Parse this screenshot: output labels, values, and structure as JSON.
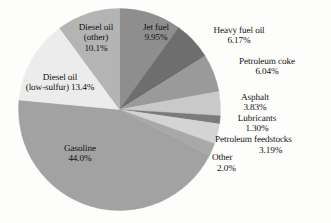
{
  "chart_data": {
    "type": "pie",
    "title": "",
    "subtitle": "",
    "xlabel": "",
    "ylabel": "",
    "legend_position": "none",
    "grid": false,
    "units": "percent",
    "start_angle_deg": 0,
    "direction": "clockwise",
    "categories": [
      "Jet fuel",
      "Heavy fuel oil",
      "Petroleum coke",
      "Asphalt",
      "Lubricants",
      "Petroleum feedstocks",
      "Other",
      "Gasoline",
      "Diesel oil (low-sulfur)",
      "Diesel oil (other)"
    ],
    "values": [
      9.95,
      6.17,
      6.04,
      3.83,
      1.3,
      3.19,
      2.0,
      44.0,
      13.4,
      10.1
    ],
    "value_labels": [
      "9.95%",
      "6.17%",
      "6.04%",
      "3.83%",
      "1.30%",
      "3.19%",
      "2.0%",
      "44.0%",
      "13.4%",
      "10.1%"
    ],
    "colors": [
      "#8e8e8e",
      "#6e6e6e",
      "#9a9a9a",
      "#c9c9c9",
      "#7b7b7b",
      "#d4d4d4",
      "#a8a8a8",
      "#a2a2a2",
      "#ececec",
      "#b4b4b4"
    ],
    "slices": [
      {
        "label": "Jet fuel",
        "value": 9.95,
        "value_label": "9.95%",
        "color": "#8e8e8e",
        "label_placement": "inside"
      },
      {
        "label": "Heavy fuel oil",
        "value": 6.17,
        "value_label": "6.17%",
        "color": "#6e6e6e",
        "label_placement": "outside"
      },
      {
        "label": "Petroleum coke",
        "value": 6.04,
        "value_label": "6.04%",
        "color": "#9a9a9a",
        "label_placement": "outside"
      },
      {
        "label": "Asphalt",
        "value": 3.83,
        "value_label": "3.83%",
        "color": "#c9c9c9",
        "label_placement": "outside"
      },
      {
        "label": "Lubricants",
        "value": 1.3,
        "value_label": "1.30%",
        "color": "#7b7b7b",
        "label_placement": "outside"
      },
      {
        "label": "Petroleum feedstocks",
        "value": 3.19,
        "value_label": "3.19%",
        "color": "#d4d4d4",
        "label_placement": "outside"
      },
      {
        "label": "Other",
        "value": 2.0,
        "value_label": "2.0%",
        "color": "#a8a8a8",
        "label_placement": "outside"
      },
      {
        "label": "Gasoline",
        "value": 44.0,
        "value_label": "44.0%",
        "color": "#a2a2a2",
        "label_placement": "inside"
      },
      {
        "label": "Diesel oil (low-sulfur)",
        "value": 13.4,
        "value_label": "13.4%",
        "color": "#ececec",
        "label_placement": "inside"
      },
      {
        "label": "Diesel oil (other)",
        "value": 10.1,
        "value_label": "10.1%",
        "color": "#b4b4b4",
        "label_placement": "inside"
      }
    ]
  },
  "labels": {
    "diesel_other_l1": "Diesel oil",
    "diesel_other_l2": "(other)",
    "diesel_other_l3": "10.1%",
    "jet_fuel_l1": "Jet fuel",
    "jet_fuel_l2": "9.95%",
    "heavy_fuel_l1": "Heavy fuel oil",
    "heavy_fuel_l2": "6.17%",
    "pet_coke_l1": "Petroleum coke",
    "pet_coke_l2": "6.04%",
    "asphalt_l1": "Asphalt",
    "asphalt_l2": "3.83%",
    "lubricants_l1": "Lubricants",
    "lubricants_l2": "1.30%",
    "feedstocks_l1": "Petroleum feedstocks",
    "feedstocks_l2": "3.19%",
    "other_l1": "Other",
    "other_l2": "2.0%",
    "gasoline_l1": "Gasoline",
    "gasoline_l2": "44.0%",
    "diesel_ls_l1": "Diesel oil",
    "diesel_ls_l2": "(low-sulfur) 13.4%"
  }
}
